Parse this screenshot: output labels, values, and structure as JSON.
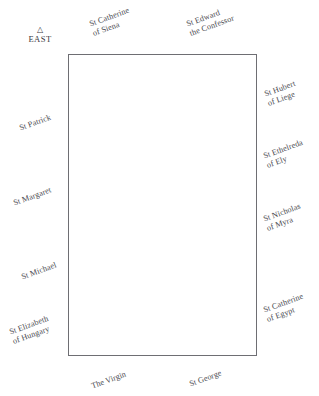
{
  "diagram": {
    "type": "architectural-floor-plan-label-key",
    "background_color": "#ffffff",
    "outline_color": "#6e6e73"
  },
  "orientation": {
    "marker_icon": "triangle-up",
    "marker_glyph": "△",
    "direction_label": "EAST"
  },
  "plan": {
    "shape": "rectangle",
    "x": 68,
    "y": 54,
    "width": 189,
    "height": 302
  },
  "labels": {
    "top": [
      {
        "id": "st-catherine-of-siena",
        "line1": "St Catherine",
        "line2": "of Siena",
        "x": 88,
        "y": 20,
        "rotation": -20
      },
      {
        "id": "st-edward-the-confessor",
        "line1": "St Edward",
        "line2": "the Confessor",
        "x": 185,
        "y": 20,
        "rotation": -20
      }
    ],
    "left": [
      {
        "id": "st-patrick",
        "line1": "St Patrick",
        "line2": "",
        "x": 18,
        "y": 124,
        "rotation": -20
      },
      {
        "id": "st-margaret",
        "line1": "St Margaret",
        "line2": "",
        "x": 12,
        "y": 199,
        "rotation": -20
      },
      {
        "id": "st-michael",
        "line1": "St Michael",
        "line2": "",
        "x": 20,
        "y": 273,
        "rotation": -20
      },
      {
        "id": "st-elizabeth-of-hungary",
        "line1": "St Elizabeth",
        "line2": "of Hungary",
        "x": 8,
        "y": 328,
        "rotation": -20
      }
    ],
    "right": [
      {
        "id": "st-hubert-of-liege",
        "line1": "St Hubert",
        "line2": "of Liege",
        "x": 263,
        "y": 90,
        "rotation": -20
      },
      {
        "id": "st-ethelreda-of-ely",
        "line1": "St Ethelreda",
        "line2": "of Ely",
        "x": 262,
        "y": 152,
        "rotation": -20
      },
      {
        "id": "st-nicholas-of-myra",
        "line1": "St Nicholas",
        "line2": "of Myra",
        "x": 262,
        "y": 215,
        "rotation": -20
      },
      {
        "id": "st-catherine-of-egypt",
        "line1": "St Catherine",
        "line2": "of Egypt",
        "x": 262,
        "y": 306,
        "rotation": -20
      }
    ],
    "bottom": [
      {
        "id": "the-virgin",
        "line1": "The Virgin",
        "line2": "",
        "x": 90,
        "y": 382,
        "rotation": -20
      },
      {
        "id": "st-george",
        "line1": "St George",
        "line2": "",
        "x": 188,
        "y": 380,
        "rotation": -20
      }
    ]
  }
}
